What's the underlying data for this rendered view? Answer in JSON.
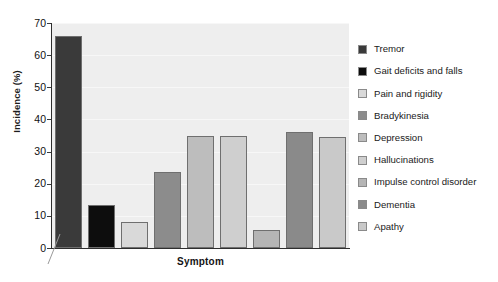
{
  "chart_data": {
    "type": "bar",
    "title": "",
    "xlabel": "Symptom",
    "ylabel": "Incidence (%)",
    "ylim": [
      0,
      70
    ],
    "ytick_labels": [
      "0",
      "10",
      "20",
      "30",
      "40",
      "50",
      "60",
      "70"
    ],
    "ytick_values": [
      0,
      10,
      20,
      30,
      40,
      50,
      60,
      70
    ],
    "grid": true,
    "legend_position": "right",
    "axis_break": true,
    "categories": [
      "Tremor",
      "Gait deficits and falls",
      "Pain and rigidity",
      "Bradykinesia",
      "Depression",
      "Hallucinations",
      "Impulse control disorder",
      "Dementia",
      "Apathy"
    ],
    "values": [
      66,
      13.5,
      8,
      23.5,
      35,
      34.8,
      5.5,
      36,
      34.5
    ],
    "colors": [
      "#3a3a3a",
      "#0d0d0d",
      "#d9d9d9",
      "#8c8c8c",
      "#bdbdbd",
      "#cfcfcf",
      "#b5b5b5",
      "#8a8a8a",
      "#c9c9c9"
    ],
    "plot_background": "#eeeeee",
    "axis_color": "#2e2e2e"
  },
  "legend": {
    "items": [
      {
        "label": "Tremor",
        "color": "#3a3a3a"
      },
      {
        "label": "Gait deficits and falls",
        "color": "#0d0d0d"
      },
      {
        "label": "Pain and rigidity",
        "color": "#d9d9d9"
      },
      {
        "label": "Bradykinesia",
        "color": "#8c8c8c"
      },
      {
        "label": "Depression",
        "color": "#bdbdbd"
      },
      {
        "label": "Hallucinations",
        "color": "#cfcfcf"
      },
      {
        "label": "Impulse control disorder",
        "color": "#b5b5b5"
      },
      {
        "label": "Dementia",
        "color": "#8a8a8a"
      },
      {
        "label": "Apathy",
        "color": "#c9c9c9"
      }
    ]
  }
}
